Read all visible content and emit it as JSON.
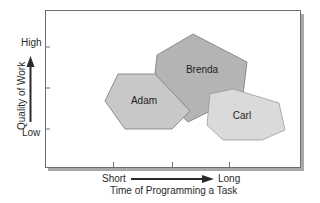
{
  "diagram": {
    "y_axis": {
      "title": "Quality of Work",
      "high_label": "High",
      "low_label": "Low"
    },
    "x_axis": {
      "title": "Time of Programming a Task",
      "short_label": "Short",
      "long_label": "Long"
    },
    "regions": [
      {
        "name": "Adam",
        "label": "Adam",
        "fill": "#c8c8c8"
      },
      {
        "name": "Brenda",
        "label": "Brenda",
        "fill": "#b4b4b4"
      },
      {
        "name": "Carl",
        "label": "Carl",
        "fill": "#dadada"
      }
    ],
    "colors": {
      "frame": "#6e6e6e",
      "frame_shadow": "#a8a8a8",
      "outline": "#777777",
      "text": "#2a2a2a"
    }
  }
}
